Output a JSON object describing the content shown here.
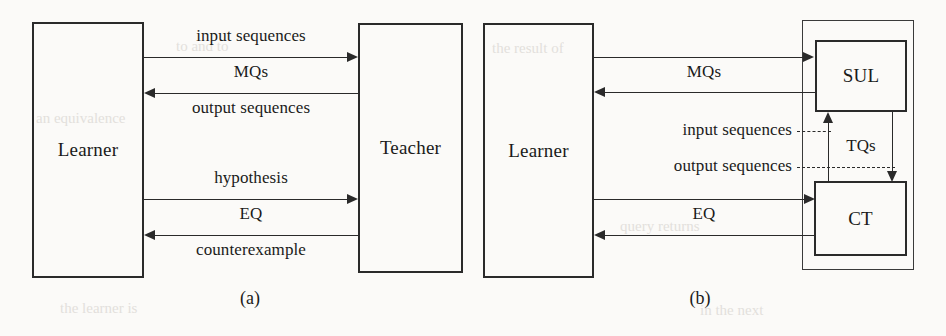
{
  "figure": {
    "background_color": "#fbfaf8",
    "line_color": "#2a2a2a"
  },
  "panel_a": {
    "caption": "(a)",
    "learner": {
      "label": "Learner"
    },
    "teacher": {
      "label": "Teacher"
    },
    "edges": [
      {
        "label_above": "input sequences",
        "direction": "right"
      },
      {
        "label_above": "MQs",
        "label_below": "output sequences",
        "direction": "left"
      },
      {
        "label_above": "hypothesis",
        "direction": "right"
      },
      {
        "label_above": "EQ",
        "label_below": "counterexample",
        "direction": "left"
      }
    ],
    "labels": {
      "input_sequences": "input sequences",
      "mqs": "MQs",
      "output_sequences": "output sequences",
      "hypothesis": "hypothesis",
      "eq": "EQ",
      "counterexample": "counterexample"
    }
  },
  "panel_b": {
    "caption": "(b)",
    "learner": {
      "label": "Learner"
    },
    "sul": {
      "label": "SUL"
    },
    "ct": {
      "label": "CT"
    },
    "labels": {
      "mqs": "MQs",
      "input_sequences": "input sequences",
      "output_sequences": "output sequences",
      "tqs": "TQs",
      "eq": "EQ"
    }
  },
  "bleed_through": {
    "lines": [
      "to and to",
      "the result of",
      "an equivalence",
      "query returns",
      "the learner is",
      "in the next"
    ]
  }
}
